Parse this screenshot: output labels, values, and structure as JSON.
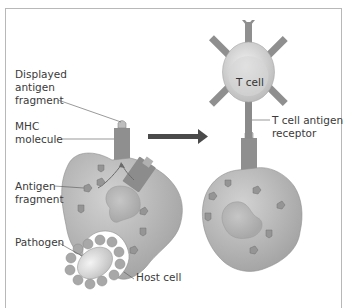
{
  "diagram": {
    "labels": {
      "displayed_antigen_fragment": [
        "Displayed",
        "antigen",
        "fragment"
      ],
      "mhc_molecule": [
        "MHC",
        "molecule"
      ],
      "antigen_fragment": [
        "Antigen",
        "fragment"
      ],
      "pathogen": "Pathogen",
      "host_cell": "Host cell",
      "t_cell": "T cell",
      "t_cell_antigen_receptor": [
        "T cell antigen",
        "receptor"
      ]
    },
    "arrow": {
      "direction": "right",
      "meaning": "leads to"
    },
    "colors": {
      "cell_fill": "#a9a9a9",
      "cell_highlight": "#cfcfcf",
      "mhc_fill": "#8f8f8f",
      "t_cell_fill": "#dedede",
      "arrow": "#4a4a4a",
      "frame": "#b8b8b8",
      "text": "#3a3a3a"
    }
  }
}
